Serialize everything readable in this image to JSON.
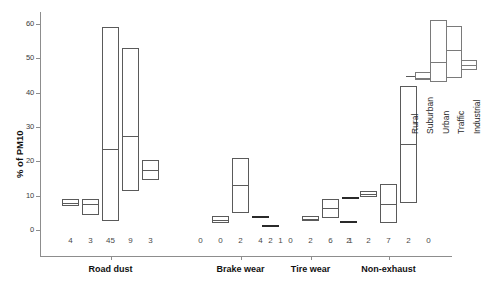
{
  "chart_data": {
    "type": "box",
    "title": "",
    "xlabel": "",
    "ylabel": "% of PM10",
    "ylim": [
      0,
      64
    ],
    "yticks": [
      0,
      10,
      20,
      30,
      40,
      50,
      60
    ],
    "ytick_labels": [
      "0",
      "10",
      "20",
      "30",
      "40",
      "50",
      "60"
    ],
    "grid": false,
    "legend_position": "top-right",
    "legend_entries": [
      "Rural",
      "Suburban",
      "Urban",
      "Traffic",
      "Industrial"
    ],
    "categories": [
      "Road dust",
      "Brake wear",
      "Tire wear",
      "Non-exhaust"
    ],
    "groups": [
      {
        "category": "Road dust",
        "boxes": [
          {
            "series": "Rural",
            "n": "4",
            "q1": 7.0,
            "median": 8.0,
            "q3": 9.0,
            "flat": false
          },
          {
            "series": "Suburban",
            "n": "3",
            "q1": 4.5,
            "median": 7.5,
            "q3": 9.0,
            "flat": false
          },
          {
            "series": "Urban",
            "n": "45",
            "q1": 2.5,
            "median": 23.5,
            "q3": 59.0,
            "flat": false
          },
          {
            "series": "Traffic",
            "n": "9",
            "q1": 11.5,
            "median": 27.5,
            "q3": 53.0,
            "flat": false
          },
          {
            "series": "Industrial",
            "n": "3",
            "q1": 14.5,
            "median": 17.5,
            "q3": 20.5,
            "flat": false
          }
        ]
      },
      {
        "category": "Brake wear",
        "boxes": [
          {
            "series": "Rural",
            "n": "0",
            "q1": null,
            "median": null,
            "q3": null,
            "flat": false,
            "empty": true
          },
          {
            "series": "Suburban",
            "n": "0",
            "q1": 2.0,
            "median": 3.0,
            "q3": 4.2,
            "flat": false
          },
          {
            "series": "Urban",
            "n": "2",
            "q1": 5.0,
            "median": 13.0,
            "q3": 21.0,
            "flat": false
          },
          {
            "series": "Traffic",
            "n": "4",
            "q1": 4.0,
            "median": 4.0,
            "q3": 4.0,
            "flat": true
          },
          {
            "series": "Industrial",
            "n": "1",
            "q1": null,
            "median": null,
            "q3": null,
            "flat": false,
            "empty": true
          }
        ]
      },
      {
        "category": "Tire wear",
        "boxes": [
          {
            "series": "Rural",
            "n": "2",
            "q1": 1.5,
            "median": 1.5,
            "q3": 1.5,
            "flat": true
          },
          {
            "series": "Suburban",
            "n": "0",
            "q1": null,
            "median": null,
            "q3": null,
            "flat": false,
            "empty": true
          },
          {
            "series": "Urban",
            "n": "2",
            "q1": 2.5,
            "median": 3.2,
            "q3": 4.0,
            "flat": false
          },
          {
            "series": "Traffic",
            "n": "6",
            "q1": 3.5,
            "median": 6.5,
            "q3": 9.0,
            "flat": false
          },
          {
            "series": "Industrial",
            "n": "1",
            "q1": 9.5,
            "median": 9.5,
            "q3": 9.5,
            "flat": true
          }
        ]
      },
      {
        "category": "Non-exhaust",
        "boxes": [
          {
            "series": "Rural",
            "n": "2",
            "q1": 2.5,
            "median": 2.5,
            "q3": 2.5,
            "flat": true
          },
          {
            "series": "Suburban",
            "n": "2",
            "q1": 9.5,
            "median": 10.5,
            "q3": 11.5,
            "flat": false
          },
          {
            "series": "Urban",
            "n": "7",
            "q1": 2.0,
            "median": 7.5,
            "q3": 13.5,
            "flat": false
          },
          {
            "series": "Traffic",
            "n": "2",
            "q1": 8.0,
            "median": 25.0,
            "q3": 42.0,
            "flat": false
          },
          {
            "series": "Industrial",
            "n": "0",
            "q1": null,
            "median": null,
            "q3": null,
            "flat": false,
            "empty": true
          }
        ]
      }
    ],
    "n_row_labels": [
      "4",
      "3",
      "45",
      "9",
      "3",
      "0",
      "0",
      "2",
      "4",
      "1",
      "2",
      "0",
      "2",
      "6",
      "1",
      "2",
      "2",
      "7",
      "2",
      "0"
    ]
  },
  "axis": {
    "y_title": "% of PM10"
  }
}
